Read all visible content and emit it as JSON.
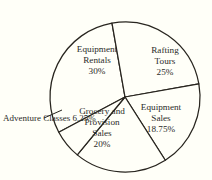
{
  "chart_data": {
    "type": "pie",
    "title": "",
    "subtitle": "",
    "xlabel": "",
    "ylabel": "",
    "legend_position": "none",
    "grid": false,
    "units": "percent",
    "total": 100,
    "categories": [
      "Equipment Rentals",
      "Rafting Tours",
      "Equipment Sales",
      "Grocery and Provision Sales",
      "Adventure Classes"
    ],
    "values": [
      30,
      25,
      18.75,
      20,
      6.25
    ],
    "slices": [
      {
        "name": "Equipment Rentals",
        "name_lines": [
          "Equipment",
          "Rentals"
        ],
        "value": 30,
        "value_label": "30%",
        "label_placement": "inside",
        "color": "#fffff8"
      },
      {
        "name": "Rafting Tours",
        "name_lines": [
          "Rafting",
          "Tours"
        ],
        "value": 25,
        "value_label": "25%",
        "label_placement": "inside",
        "color": "#fffff8"
      },
      {
        "name": "Equipment Sales",
        "name_lines": [
          "Equipment",
          "Sales"
        ],
        "value": 18.75,
        "value_label": "18.75%",
        "label_placement": "inside",
        "color": "#fffff8"
      },
      {
        "name": "Grocery and Provision Sales",
        "name_lines": [
          "Grocery and",
          "Provision",
          "Sales"
        ],
        "value": 20,
        "value_label": "20%",
        "label_placement": "inside",
        "color": "#fffff8"
      },
      {
        "name": "Adventure Classes",
        "name_lines": [
          "Adventure",
          "Classes"
        ],
        "value": 6.25,
        "value_label": "6.25%",
        "label_placement": "outside-left",
        "color": "#fffff8"
      }
    ]
  },
  "labels": {
    "rentals": {
      "line1": "Equipment",
      "line2": "Rentals",
      "value": "30%"
    },
    "rafting": {
      "line1": "Rafting",
      "line2": "Tours",
      "value": "25%"
    },
    "equipsales": {
      "line1": "Equipment",
      "line2": "Sales",
      "value": "18.75%"
    },
    "grocery": {
      "line1": "Grocery and",
      "line2": "Provision",
      "line3": "Sales",
      "value": "20%"
    },
    "adventure": {
      "line1": "Adventure",
      "line2": "Classes",
      "value": "6.25%"
    }
  },
  "style": {
    "background": "#fffff8",
    "stroke": "#28251f",
    "text": "#2b2b28",
    "slice_fill": "#fffff8"
  },
  "geometry": {
    "center_x": 125,
    "center_y": 97,
    "radius": 75
  }
}
